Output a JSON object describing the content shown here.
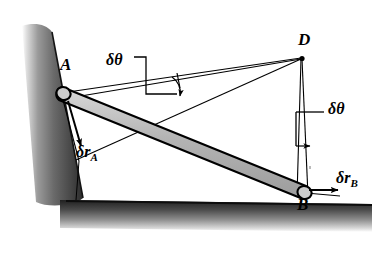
{
  "figure": {
    "kind": "mechanics-diagram",
    "background_color": "#ffffff",
    "ink_color": "#000000",
    "rod_fill_color": "#b8b8b8",
    "wall_shade_color": "#3a3a3a",
    "ground_shade_color": "#2e2e2e"
  },
  "labels": {
    "point_a": "A",
    "point_b": "B",
    "point_d": "D",
    "delta_theta_left": "δθ",
    "delta_theta_right": "δθ",
    "delta_r_a_symbol": "δr",
    "delta_r_a_subscript": "A",
    "delta_r_b_symbol": "δr",
    "delta_r_b_subscript": "B"
  },
  "geometry": {
    "rod_end_a": [
      62,
      93
    ],
    "rod_end_b": [
      306,
      192
    ],
    "instant_centre_d": [
      302,
      58
    ],
    "wall_top": [
      28,
      28
    ],
    "wall_bottom": [
      70,
      205
    ],
    "ground_left": [
      70,
      209
    ],
    "ground_right": [
      372,
      213
    ]
  }
}
